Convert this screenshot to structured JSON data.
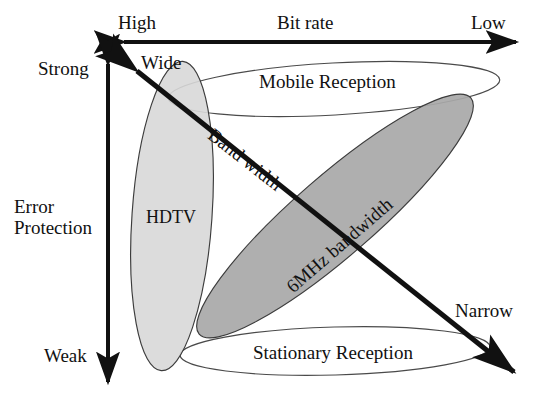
{
  "figure": {
    "type": "concept-diagram"
  },
  "horizontal_axis": {
    "title": "Bit rate",
    "left_label": "High",
    "right_label": "Low",
    "style": "double-headed-arrow"
  },
  "vertical_axis": {
    "title_line1": "Error",
    "title_line2": "Protection",
    "top_label": "Strong",
    "bottom_label": "Weak",
    "style": "double-headed-arrow"
  },
  "diagonal_axis": {
    "title": "Band width",
    "upper_left_label": "Wide",
    "lower_right_label": "Narrow",
    "style": "double-headed-arrow"
  },
  "regions": [
    {
      "id": "mobile",
      "label": "Mobile Reception",
      "shape": "ellipse",
      "fill": "none"
    },
    {
      "id": "stationary",
      "label": "Stationary Reception",
      "shape": "ellipse",
      "fill": "none"
    },
    {
      "id": "hdtv",
      "label": "HDTV",
      "shape": "ellipse",
      "fill": "light-gray"
    },
    {
      "id": "sixmhz",
      "label": "6MHz bandwidth",
      "shape": "ellipse",
      "fill": "medium-gray"
    }
  ],
  "colors": {
    "stroke": "#111111",
    "background": "#ffffff",
    "light_gray_fill": "#d8d8d8",
    "medium_gray_fill": "#a8a8a8",
    "outline_gray": "#4a4a4a"
  }
}
